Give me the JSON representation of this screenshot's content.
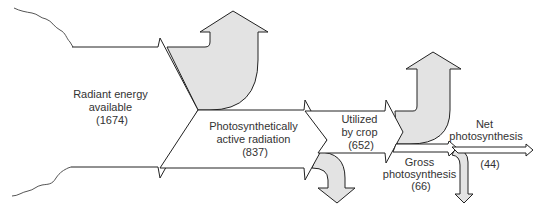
{
  "diagram": {
    "type": "energy-flow (sankey)",
    "nodes": [
      {
        "id": "radiant",
        "label_lines": [
          "Radiant energy",
          "available",
          "(1674)"
        ],
        "value": 1674
      },
      {
        "id": "par",
        "label_lines": [
          "Photosynthetically",
          "active radiation",
          "(837)"
        ],
        "value": 837
      },
      {
        "id": "crop",
        "label_lines": [
          "Utilized",
          "by crop",
          "(652)"
        ],
        "value": 652
      },
      {
        "id": "gross",
        "label_lines": [
          "Gross",
          "photosynthesis",
          "(66)"
        ],
        "value": 66
      },
      {
        "id": "net",
        "label_lines": [
          "Net",
          "photosynthesis"
        ],
        "value_label": "(44)",
        "value": 44
      }
    ],
    "losses": [
      {
        "from": "radiant",
        "direction": "up",
        "style": "grey-arrow"
      },
      {
        "from": "par",
        "direction": "down",
        "style": "grey-arrow"
      },
      {
        "from": "crop",
        "direction": "up",
        "style": "grey-arrow"
      },
      {
        "from": "gross",
        "direction": "down",
        "style": "grey-arrow"
      }
    ],
    "colors": {
      "flow_fill": "#ffffff",
      "loss_fill": "#e3e3e3",
      "stroke": "#222222"
    }
  }
}
